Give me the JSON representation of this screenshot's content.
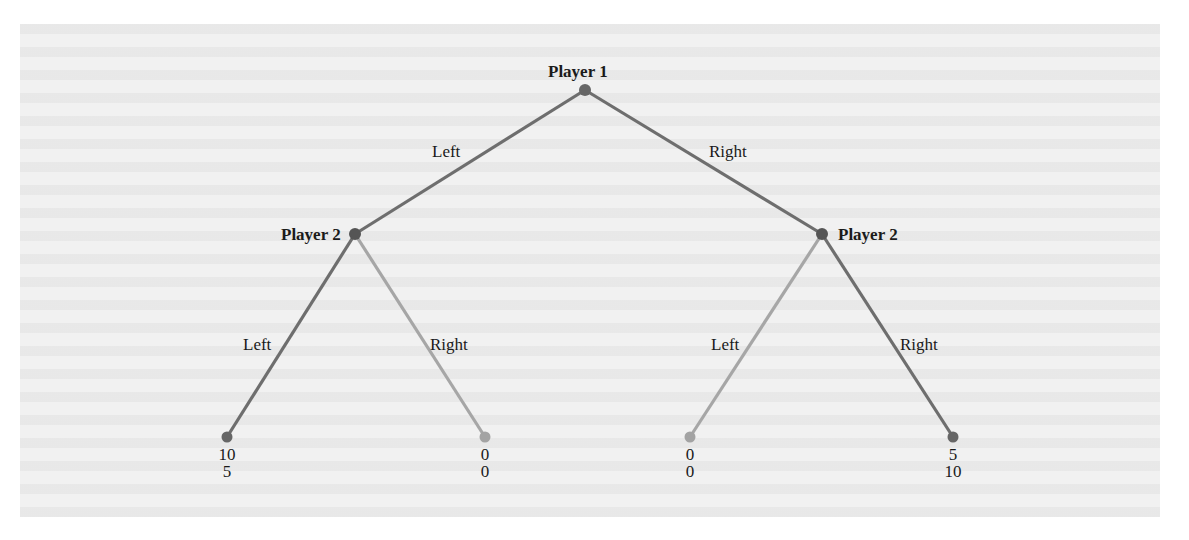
{
  "figure": {
    "colors": {
      "panel_background": "#f1f1f1",
      "edge_dark": "#6e6e6e",
      "edge_light": "#a6a6a6",
      "node_dark": "#666666",
      "node_light": "#a3a3a3",
      "text": "#1a1a1a"
    }
  },
  "nodes": {
    "root": {
      "label": "Player 1"
    },
    "left_decision": {
      "label": "Player 2"
    },
    "right_decision": {
      "label": "Player 2"
    }
  },
  "edges": {
    "root_left": "Left",
    "root_right": "Right",
    "left_left": "Left",
    "left_right": "Right",
    "right_left": "Left",
    "right_right": "Right"
  },
  "leaves": [
    {
      "path": "Left-Left",
      "player1_payoff": "10",
      "player2_payoff": "5"
    },
    {
      "path": "Left-Right",
      "player1_payoff": "0",
      "player2_payoff": "0"
    },
    {
      "path": "Right-Left",
      "player1_payoff": "0",
      "player2_payoff": "0"
    },
    {
      "path": "Right-Right",
      "player1_payoff": "5",
      "player2_payoff": "10"
    }
  ]
}
